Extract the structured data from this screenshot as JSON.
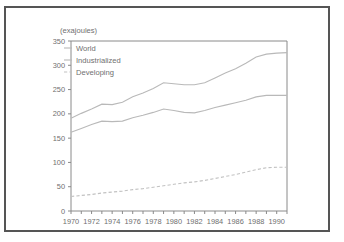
{
  "chart_data": {
    "type": "line",
    "title": "",
    "subtitle": "",
    "xlabel": "",
    "ylabel": "(exajoules)",
    "ylim": [
      0,
      350
    ],
    "xlim": [
      1970,
      1991
    ],
    "yticks": [
      0,
      50,
      100,
      150,
      200,
      250,
      300,
      350
    ],
    "xticks": [
      1970,
      1971,
      1972,
      1973,
      1974,
      1975,
      1976,
      1977,
      1978,
      1979,
      1980,
      1981,
      1982,
      1983,
      1984,
      1985,
      1986,
      1987,
      1988,
      1989,
      1990,
      1991
    ],
    "xtick_labels": [
      "1970",
      "",
      "1972",
      "",
      "1974",
      "",
      "1976",
      "",
      "1978",
      "",
      "1980",
      "",
      "1982",
      "",
      "1984",
      "",
      "1986",
      "",
      "1988",
      "",
      "1990",
      ""
    ],
    "ytick_labels": [
      "0",
      "50",
      "100",
      "150",
      "200",
      "250",
      "300",
      "350"
    ],
    "grid": false,
    "legend_position": "top-left",
    "x": [
      1970,
      1971,
      1972,
      1973,
      1974,
      1975,
      1976,
      1977,
      1978,
      1979,
      1980,
      1981,
      1982,
      1983,
      1984,
      1985,
      1986,
      1987,
      1988,
      1989,
      1990,
      1991
    ],
    "series": [
      {
        "name": "World",
        "style": "solid",
        "color": "#b9b9b9",
        "values": [
          191,
          201,
          210,
          220,
          219,
          224,
          235,
          243,
          252,
          264,
          262,
          260,
          260,
          264,
          274,
          284,
          293,
          304,
          317,
          323,
          325,
          326
        ]
      },
      {
        "name": "Industrialized",
        "style": "solid",
        "color": "#b9b9b9",
        "values": [
          162,
          170,
          178,
          185,
          184,
          185,
          192,
          197,
          203,
          210,
          207,
          203,
          202,
          207,
          213,
          218,
          223,
          228,
          235,
          238,
          238,
          238
        ]
      },
      {
        "name": "Developing",
        "style": "dashed",
        "color": "#c2c2c2",
        "values": [
          30,
          32,
          34,
          37,
          39,
          41,
          44,
          46,
          49,
          52,
          55,
          58,
          60,
          63,
          67,
          71,
          75,
          80,
          85,
          89,
          90,
          90
        ]
      }
    ]
  },
  "legend": {
    "items": [
      {
        "label": "World"
      },
      {
        "label": "Industrialized"
      },
      {
        "label": "Developing"
      }
    ]
  }
}
